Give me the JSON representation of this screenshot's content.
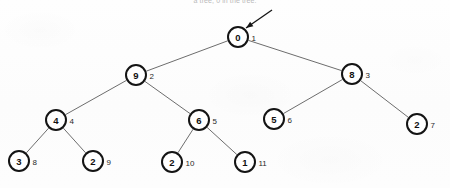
{
  "figure": {
    "caption": "a tree; 0 in the tree.",
    "width": 450,
    "height": 188,
    "background_color": "#fdfdfd",
    "node_stroke_color": "#141414",
    "edge_color": "#6d6d6d"
  },
  "pointer": {
    "label": "root-pointer-arrow",
    "target_node_index": "1",
    "tail_x": 272,
    "tail_y": 10,
    "tip_x": 246,
    "tip_y": 28
  },
  "tree": {
    "type": "binary-heap-array-tree",
    "nodes": [
      {
        "key": "0",
        "index": "1",
        "x": 238,
        "y": 37,
        "r": 10,
        "level": 0
      },
      {
        "key": "9",
        "index": "2",
        "x": 136,
        "y": 75,
        "r": 10,
        "level": 1
      },
      {
        "key": "8",
        "index": "3",
        "x": 352,
        "y": 74,
        "r": 10,
        "level": 1
      },
      {
        "key": "4",
        "index": "4",
        "x": 56,
        "y": 120,
        "r": 10,
        "level": 2
      },
      {
        "key": "6",
        "index": "5",
        "x": 199,
        "y": 120,
        "r": 10,
        "level": 2
      },
      {
        "key": "5",
        "index": "6",
        "x": 274,
        "y": 119,
        "r": 10,
        "level": 2
      },
      {
        "key": "2",
        "index": "7",
        "x": 417,
        "y": 124,
        "r": 10,
        "level": 2
      },
      {
        "key": "3",
        "index": "8",
        "x": 19,
        "y": 161,
        "r": 10,
        "level": 3
      },
      {
        "key": "2",
        "index": "9",
        "x": 93,
        "y": 161,
        "r": 10,
        "level": 3
      },
      {
        "key": "2",
        "index": "10",
        "x": 172,
        "y": 162,
        "r": 10,
        "level": 3
      },
      {
        "key": "1",
        "index": "11",
        "x": 245,
        "y": 162,
        "r": 10,
        "level": 3
      }
    ],
    "edges": [
      {
        "from": "1",
        "to": "2"
      },
      {
        "from": "1",
        "to": "3"
      },
      {
        "from": "2",
        "to": "4"
      },
      {
        "from": "2",
        "to": "5"
      },
      {
        "from": "3",
        "to": "6"
      },
      {
        "from": "3",
        "to": "7"
      },
      {
        "from": "4",
        "to": "8"
      },
      {
        "from": "4",
        "to": "9"
      },
      {
        "from": "5",
        "to": "10"
      },
      {
        "from": "5",
        "to": "11"
      }
    ]
  }
}
